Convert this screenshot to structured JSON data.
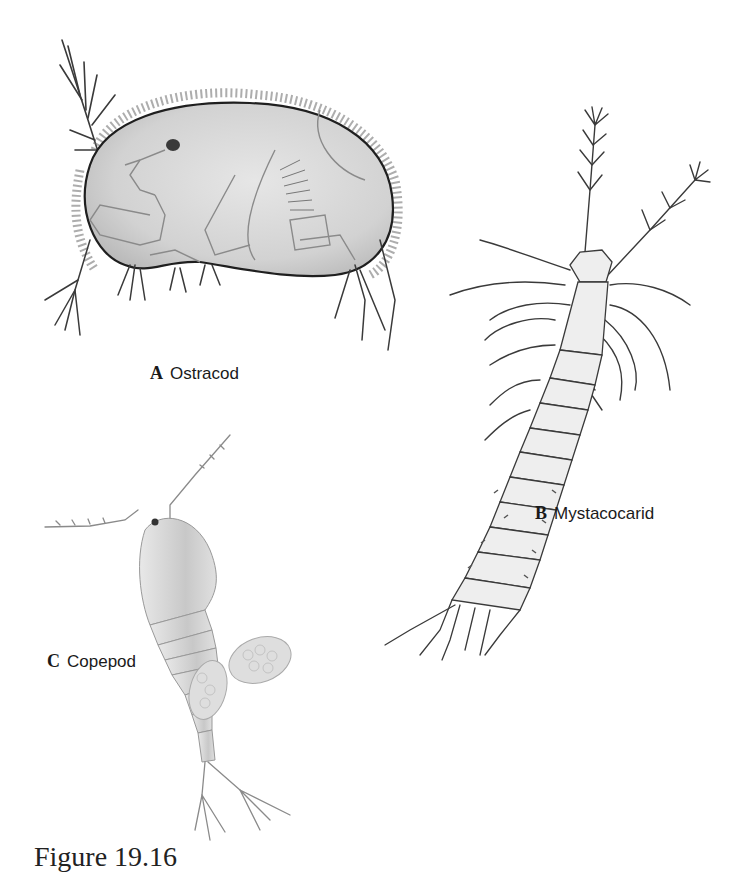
{
  "figure": {
    "caption": "Figure 19.16",
    "panels": [
      {
        "letter": "A",
        "name": "Ostracod"
      },
      {
        "letter": "B",
        "name": "Mystacocarid"
      },
      {
        "letter": "C",
        "name": "Copepod"
      }
    ]
  },
  "colors": {
    "background": "#ffffff",
    "outline": "#2a2a2a",
    "body_fill": "#dcdcdc",
    "light_fill": "#ececec"
  }
}
